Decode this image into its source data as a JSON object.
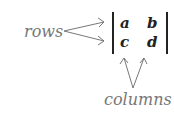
{
  "diagram": {
    "row_label": "rows",
    "column_label": "columns",
    "matrix": {
      "cells": [
        [
          "a",
          "b"
        ],
        [
          "c",
          "d"
        ]
      ]
    },
    "colors": {
      "label": "#777777",
      "arrow": "#777777",
      "matrix": "#222222"
    }
  }
}
